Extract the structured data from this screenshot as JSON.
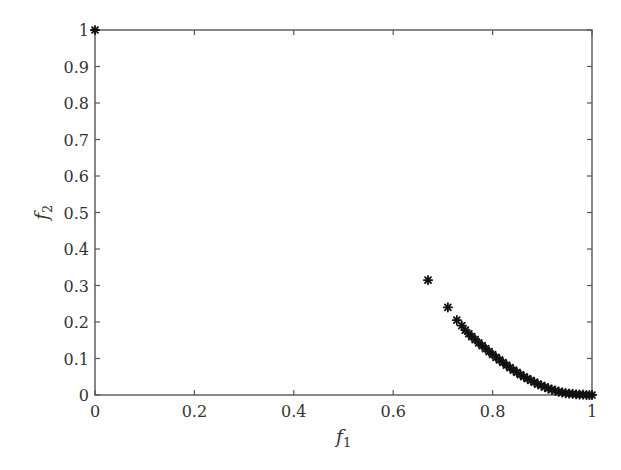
{
  "chart_data": {
    "type": "scatter",
    "title": "",
    "xlabel": "f1",
    "ylabel": "f2",
    "xlabel_main": "f",
    "xlabel_sub": "1",
    "ylabel_main": "f",
    "ylabel_sub": "2",
    "xlim": [
      0,
      1
    ],
    "ylim": [
      0,
      1
    ],
    "grid": false,
    "legend": null,
    "marker": "asterisk",
    "marker_color": "#111111",
    "axis_color": "#555555",
    "x_ticks": [
      0,
      0.2,
      0.4,
      0.6,
      0.8,
      1
    ],
    "x_tick_labels": [
      "0",
      "0.2",
      "0.4",
      "0.6",
      "0.8",
      "1"
    ],
    "y_ticks": [
      0,
      0.1,
      0.2,
      0.3,
      0.4,
      0.5,
      0.6,
      0.7,
      0.8,
      0.9,
      1
    ],
    "y_tick_labels": [
      "0",
      "0.1",
      "0.2",
      "0.3",
      "0.4",
      "0.5",
      "0.6",
      "0.7",
      "0.8",
      "0.9",
      "1"
    ],
    "series": [
      {
        "name": "Pareto front",
        "points": [
          [
            0.0,
            1.0
          ],
          [
            0.67,
            0.315
          ],
          [
            0.71,
            0.24
          ],
          [
            0.728,
            0.205
          ],
          [
            0.738,
            0.19
          ],
          [
            0.745,
            0.178
          ],
          [
            0.752,
            0.168
          ],
          [
            0.758,
            0.16
          ],
          [
            0.765,
            0.152
          ],
          [
            0.772,
            0.143
          ],
          [
            0.779,
            0.135
          ],
          [
            0.786,
            0.127
          ],
          [
            0.793,
            0.119
          ],
          [
            0.8,
            0.111
          ],
          [
            0.807,
            0.103
          ],
          [
            0.814,
            0.096
          ],
          [
            0.821,
            0.089
          ],
          [
            0.828,
            0.082
          ],
          [
            0.835,
            0.075
          ],
          [
            0.842,
            0.068
          ],
          [
            0.849,
            0.062
          ],
          [
            0.856,
            0.056
          ],
          [
            0.863,
            0.05
          ],
          [
            0.87,
            0.045
          ],
          [
            0.877,
            0.04
          ],
          [
            0.884,
            0.035
          ],
          [
            0.891,
            0.03
          ],
          [
            0.898,
            0.026
          ],
          [
            0.905,
            0.022
          ],
          [
            0.912,
            0.018
          ],
          [
            0.919,
            0.015
          ],
          [
            0.926,
            0.012
          ],
          [
            0.933,
            0.009
          ],
          [
            0.94,
            0.007
          ],
          [
            0.947,
            0.005
          ],
          [
            0.954,
            0.004
          ],
          [
            0.961,
            0.003
          ],
          [
            0.968,
            0.002
          ],
          [
            0.975,
            0.001
          ],
          [
            0.982,
            0.001
          ],
          [
            0.989,
            0.0
          ],
          [
            0.995,
            0.0
          ],
          [
            1.0,
            0.0
          ]
        ]
      }
    ]
  }
}
